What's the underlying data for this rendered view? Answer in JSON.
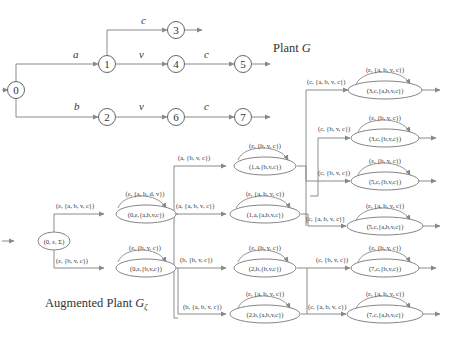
{
  "plant": {
    "title": "Plant G",
    "title_main": "Plant ",
    "title_sym": "G",
    "nodes": [
      {
        "id": "0",
        "x": 16,
        "y": 90
      },
      {
        "id": "1",
        "x": 107,
        "y": 64
      },
      {
        "id": "2",
        "x": 107,
        "y": 117
      },
      {
        "id": "3",
        "x": 176,
        "y": 30
      },
      {
        "id": "4",
        "x": 176,
        "y": 64
      },
      {
        "id": "5",
        "x": 243,
        "y": 64
      },
      {
        "id": "6",
        "x": 176,
        "y": 117
      },
      {
        "id": "7",
        "x": 243,
        "y": 117
      }
    ],
    "edges": [
      {
        "from": "0",
        "to": "1",
        "label": "a"
      },
      {
        "from": "0",
        "to": "2",
        "label": "b"
      },
      {
        "from": "1",
        "to": "3",
        "label": "c"
      },
      {
        "from": "1",
        "to": "4",
        "label": "v"
      },
      {
        "from": "4",
        "to": "5",
        "label": "c"
      },
      {
        "from": "2",
        "to": "6",
        "label": "v"
      },
      {
        "from": "6",
        "to": "7",
        "label": "c"
      }
    ]
  },
  "augmented": {
    "title": "Augmented Plant Gζ",
    "title_main": "Augmented Plant ",
    "title_sym": "G",
    "title_sub": "ζ",
    "initial": {
      "label": "(0, ε, Σ)",
      "x": 16,
      "y": 241
    },
    "states": [
      {
        "id": "0e_abvc",
        "label": "(0,ε,{a,b,v,c})",
        "loop": "(ε, {a, b, d, v})",
        "x": 146,
        "y": 214
      },
      {
        "id": "0e_bvc",
        "label": "(0,ε,{b,v,c})",
        "loop": "(ε, {b, v, c})",
        "x": 146,
        "y": 268
      },
      {
        "id": "1a_bvc",
        "label": "(1,a,{b,v,c})",
        "loop": "(ε, {b, v, c})",
        "x": 265,
        "y": 166
      },
      {
        "id": "1a_abvc",
        "label": "(1,a,{a,b,v,c})",
        "loop": "(ε, {a, b, v, c})",
        "x": 265,
        "y": 214
      },
      {
        "id": "2b_bvc",
        "label": "(2,b,{b,v,c})",
        "loop": "(ε, {b, v, c})",
        "x": 265,
        "y": 268
      },
      {
        "id": "2b_abvc",
        "label": "(2,b,{a,b,v,c})",
        "loop": "(ε, {a, b, v, c})",
        "x": 265,
        "y": 314
      },
      {
        "id": "3c_abvc",
        "label": "(3,c,{a,b,v,c})",
        "loop": "(ε, {a, b, v, c})",
        "x": 385,
        "y": 90
      },
      {
        "id": "3c_bvc",
        "label": "(3,c,{b,v,c})",
        "loop": "(ε, {b, v, c})",
        "x": 385,
        "y": 138
      },
      {
        "id": "5c_bvc",
        "label": "(5,c,{b,v,c})",
        "loop": "(ε, {b, v, c})",
        "x": 385,
        "y": 181
      },
      {
        "id": "5c_abvc",
        "label": "(5,c,{a,b,v,c})",
        "loop": "(ε, {a, b, v, c})",
        "x": 385,
        "y": 226
      },
      {
        "id": "7c_bvc",
        "label": "(7,c,{b,v,c})",
        "loop": "(ε, {b, v, c})",
        "x": 385,
        "y": 268
      },
      {
        "id": "7c_abvc",
        "label": "(7,c,{a,b,v,c})",
        "loop": "(ε, {a, b, v, c})",
        "x": 385,
        "y": 314
      }
    ],
    "edge_labels": {
      "init_to_0e_abvc": "(ε, {a, b, v, c})",
      "init_to_0e_bvc": "(ε, {b, v, c})",
      "to_1a_bvc": "(a, {b, v, c})",
      "to_1a_abvc": "(a, {a, b, v, c})",
      "to_2b_bvc": "(b, {b, v, c})",
      "to_2b_abvc": "(b, {a, b, v, c})",
      "to_3c_abvc": "(c, {a, b, v, c})",
      "to_3c_bvc": "(c, {b, v, c})",
      "to_5c_bvc": "(c, {b, v, c})",
      "to_5c_abvc": "[c, {a, b, v, c}]",
      "to_7c_bvc": "(c, {b, v, c})",
      "to_7c_abvc": "(c, {a, b, v, c})"
    }
  }
}
